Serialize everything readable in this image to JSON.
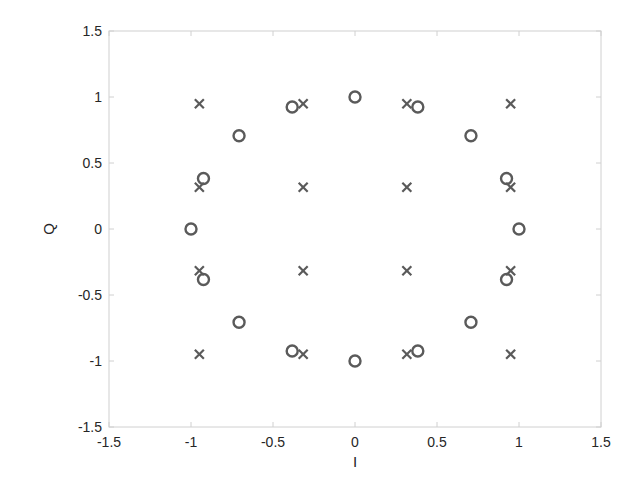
{
  "chart_data": {
    "type": "scatter",
    "title": "",
    "xlabel": "I",
    "ylabel": "Q",
    "xlim": [
      -1.5,
      1.5
    ],
    "ylim": [
      -1.5,
      1.5
    ],
    "xticks": [
      -1.5,
      -1,
      -0.5,
      0,
      0.5,
      1,
      1.5
    ],
    "yticks": [
      -1.5,
      -1,
      -0.5,
      0,
      0.5,
      1,
      1.5
    ],
    "xtick_labels": [
      "-1.5",
      "-1",
      "-0.5",
      "0",
      "0.5",
      "1",
      "1.5"
    ],
    "ytick_labels": [
      "-1.5",
      "-1",
      "-0.5",
      "0",
      "0.5",
      "1",
      "1.5"
    ],
    "grid": false,
    "legend": null,
    "series": [
      {
        "name": "16-QAM",
        "marker": "x",
        "color": "#5a5a5a",
        "points": [
          [
            -0.949,
            0.949
          ],
          [
            -0.316,
            0.949
          ],
          [
            0.316,
            0.949
          ],
          [
            0.949,
            0.949
          ],
          [
            -0.949,
            0.316
          ],
          [
            -0.316,
            0.316
          ],
          [
            0.316,
            0.316
          ],
          [
            0.949,
            0.316
          ],
          [
            -0.949,
            -0.316
          ],
          [
            -0.316,
            -0.316
          ],
          [
            0.316,
            -0.316
          ],
          [
            0.949,
            -0.316
          ],
          [
            -0.949,
            -0.949
          ],
          [
            -0.316,
            -0.949
          ],
          [
            0.316,
            -0.949
          ],
          [
            0.949,
            -0.949
          ]
        ]
      },
      {
        "name": "16-PSK",
        "marker": "o",
        "color": "#5a5a5a",
        "points": [
          [
            1.0,
            0.0
          ],
          [
            0.924,
            0.383
          ],
          [
            0.707,
            0.707
          ],
          [
            0.383,
            0.924
          ],
          [
            0.0,
            1.0
          ],
          [
            -0.383,
            0.924
          ],
          [
            -0.707,
            0.707
          ],
          [
            -0.924,
            0.383
          ],
          [
            -1.0,
            0.0
          ],
          [
            -0.924,
            -0.383
          ],
          [
            -0.707,
            -0.707
          ],
          [
            -0.383,
            -0.924
          ],
          [
            0.0,
            -1.0
          ],
          [
            0.383,
            -0.924
          ],
          [
            0.707,
            -0.707
          ],
          [
            0.924,
            -0.383
          ]
        ]
      }
    ]
  },
  "layout": {
    "plot_left": 109,
    "plot_top": 31,
    "plot_right": 601,
    "plot_bottom": 427,
    "axis_color": "#d0d0d0",
    "text_color": "#262626"
  }
}
